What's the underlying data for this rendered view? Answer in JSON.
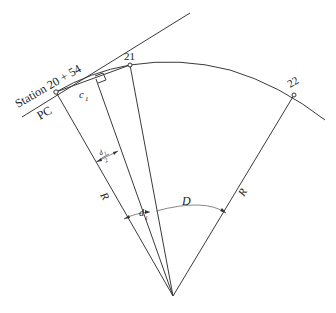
{
  "diagram": {
    "labels": {
      "station_pc": "Station 20 + 54",
      "pc": "PC",
      "station_21": "21",
      "station_22": "22",
      "chord": "c",
      "chord_sub": "1",
      "radius_left": "R",
      "radius_right": "R",
      "half_angle_num": "d",
      "half_angle_num_sub": "1",
      "half_angle_den": "2",
      "central_angle_small": "d",
      "central_angle_small_sub": "1",
      "degree_of_curve": "D"
    },
    "colors": {
      "line": "#3a3a3a",
      "text": "#222222",
      "background": "#ffffff"
    }
  }
}
